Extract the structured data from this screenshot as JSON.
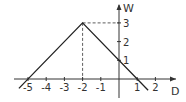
{
  "chart_data": {
    "type": "line",
    "title": "",
    "xlabel": "D",
    "ylabel": "W",
    "x": [
      -5.5,
      -5,
      -2,
      1,
      1.5
    ],
    "values": [
      -0.5,
      0,
      3,
      0,
      -0.5
    ],
    "series": [
      {
        "name": "W(D)",
        "x": [
          -5.5,
          -2,
          1.6
        ],
        "y": [
          -0.5,
          3,
          -0.6
        ]
      }
    ],
    "key_points": [
      {
        "x": -5,
        "y": 0
      },
      {
        "x": -2,
        "y": 3
      },
      {
        "x": 0,
        "y": 1
      },
      {
        "x": 1,
        "y": 0
      }
    ],
    "x_ticks": [
      "-5",
      "-4",
      "-3",
      "-2",
      "-1",
      "1",
      "2"
    ],
    "y_ticks": [
      "1",
      "2",
      "3"
    ],
    "xlim": [
      -5.7,
      2.6
    ],
    "ylim": [
      -0.6,
      3.8
    ],
    "grid": false,
    "annotations": [
      "dashed guide lines from peak (-2, 3) to both axes"
    ]
  },
  "axes": {
    "x_name": "D",
    "y_name": "W"
  },
  "ticks": {
    "x": [
      {
        "v": -5,
        "label": "-5"
      },
      {
        "v": -4,
        "label": "-4"
      },
      {
        "v": -3,
        "label": "-3"
      },
      {
        "v": -2,
        "label": "-2"
      },
      {
        "v": -1,
        "label": "-1"
      },
      {
        "v": 1,
        "label": "1"
      },
      {
        "v": 2,
        "label": "2"
      }
    ],
    "y": [
      {
        "v": 1,
        "label": "1"
      },
      {
        "v": 2,
        "label": "2"
      },
      {
        "v": 3,
        "label": "3"
      }
    ]
  }
}
